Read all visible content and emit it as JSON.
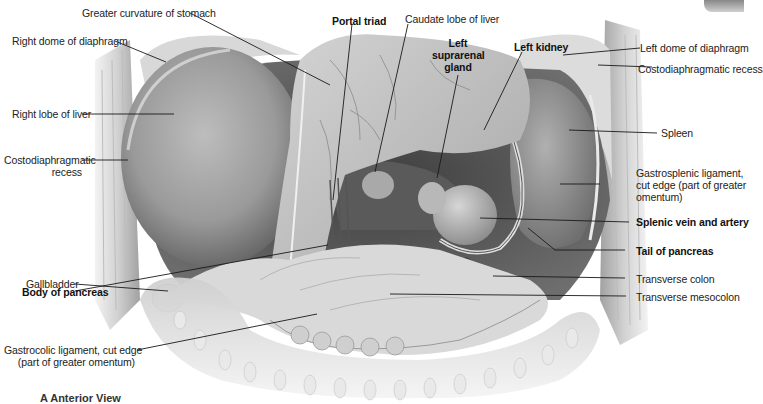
{
  "figure": {
    "caption_letter": "A",
    "caption_text": "Anterior View"
  },
  "labels": {
    "greater_curvature": "Greater curvature of stomach",
    "portal_triad": "Portal triad",
    "caudate_lobe": "Caudate lobe of liver",
    "left_suprarenal_1": "Left",
    "left_suprarenal_2": "suprarenal",
    "left_suprarenal_3": "gland",
    "left_kidney": "Left kidney",
    "right_dome": "Right dome of diaphragm",
    "left_dome": "Left dome of diaphragm",
    "costo_recess_right_1": "Costodiaphragmatic",
    "costo_recess_right_2": "recess",
    "costo_recess_left": "Costodiaphragmatic recess",
    "right_lobe_liver": "Right lobe of liver",
    "spleen": "Spleen",
    "gastrosplenic_1": "Gastrosplenic ligament,",
    "gastrosplenic_2": "cut edge (part of greater",
    "gastrosplenic_3": "omentum)",
    "splenic_vessels": "Splenic vein and artery",
    "gallbladder": "Gallbladder",
    "tail_pancreas": "Tail of pancreas",
    "body_pancreas": "Body of pancreas",
    "transverse_colon": "Transverse colon",
    "transverse_mesocolon": "Transverse mesocolon",
    "gastrocolic_1": "Gastrocolic ligament, cut edge",
    "gastrocolic_2": "(part of greater omentum)"
  },
  "colors": {
    "leader_line": "#1a1a1a",
    "organ_dark": "#6e6e6e",
    "organ_mid": "#a8a8a8",
    "organ_light": "#e2e2e2",
    "background": "#ffffff"
  }
}
